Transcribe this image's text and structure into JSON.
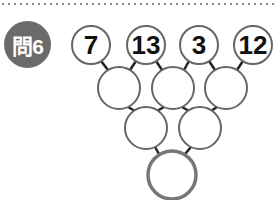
{
  "problem": {
    "label": "問6"
  },
  "top_numbers": [
    "7",
    "13",
    "3",
    "12"
  ],
  "circles": {
    "row1": [
      {
        "x": 91,
        "y": 45,
        "r": 19
      },
      {
        "x": 146,
        "y": 45,
        "r": 19
      },
      {
        "x": 199,
        "y": 45,
        "r": 19
      },
      {
        "x": 253,
        "y": 45,
        "r": 19
      }
    ],
    "row2": [
      {
        "x": 119,
        "y": 88,
        "r": 21
      },
      {
        "x": 173,
        "y": 88,
        "r": 21
      },
      {
        "x": 226,
        "y": 88,
        "r": 21
      }
    ],
    "row3": [
      {
        "x": 146,
        "y": 128,
        "r": 21
      },
      {
        "x": 200,
        "y": 128,
        "r": 21
      }
    ],
    "row4": [
      {
        "x": 172,
        "y": 175,
        "r": 24
      }
    ]
  },
  "colors": {
    "badge": "#6b6b6b",
    "circle_stroke": "#666666",
    "line": "#222222"
  }
}
